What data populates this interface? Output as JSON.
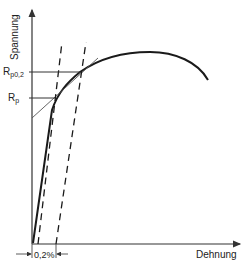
{
  "diagram": {
    "type": "stress-strain diagram",
    "y_axis_label": "Spannung",
    "x_axis_label": "Dehnung",
    "labels": {
      "rp02_main": "R",
      "rp02_sub": "p0,2",
      "rp_main": "R",
      "rp_sub": "p",
      "offset": "0,2%"
    },
    "colors": {
      "line": "#1a1a1a",
      "axis": "#333333",
      "thin": "#555555"
    }
  }
}
